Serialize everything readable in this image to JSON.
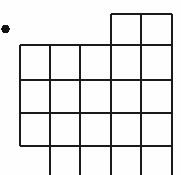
{
  "figure": {
    "kind": "grid-polyomino-diagram",
    "width": 181,
    "height": 175,
    "background_color": "#fefefe",
    "line_color": "#1a1a1a",
    "line_width": 2.2,
    "dot_color": "#111111",
    "marker": {
      "name": "bullet-dot",
      "cx": 5.5,
      "cy": 29,
      "r": 4.2
    },
    "geometry": {
      "column_x": [
        20,
        50,
        80,
        111,
        141,
        172
      ],
      "row_y": [
        14,
        45,
        80,
        113,
        146,
        178
      ],
      "columns": 5,
      "rows": 5,
      "cell_width": 30.4,
      "cell_height": 32.8,
      "clipped_bottom": true
    },
    "segments": {
      "horizontal": [
        {
          "name": "h-top-partial",
          "y": 14,
          "x1": 111,
          "x2": 172
        },
        {
          "name": "h-second",
          "y": 45,
          "x1": 20,
          "x2": 172
        },
        {
          "name": "h-third",
          "y": 80,
          "x1": 20,
          "x2": 172
        },
        {
          "name": "h-fourth",
          "y": 113,
          "x1": 20,
          "x2": 172
        },
        {
          "name": "h-fifth",
          "y": 146,
          "x1": 20,
          "x2": 172
        }
      ],
      "vertical": [
        {
          "name": "v-col1-left",
          "x": 20,
          "y1": 45,
          "y2": 146
        },
        {
          "name": "v-col2-left",
          "x": 50,
          "y1": 45,
          "y2": 175
        },
        {
          "name": "v-col3-left",
          "x": 80,
          "y1": 45,
          "y2": 175
        },
        {
          "name": "v-col4-left",
          "x": 111,
          "y1": 14,
          "y2": 175
        },
        {
          "name": "v-col5-left",
          "x": 141,
          "y1": 14,
          "y2": 175
        },
        {
          "name": "v-col5-right",
          "x": 172,
          "y1": 14,
          "y2": 175
        }
      ]
    },
    "cells": [
      {
        "name": "cell-r1c4",
        "row": 1,
        "col": 4
      },
      {
        "name": "cell-r1c5",
        "row": 1,
        "col": 5
      },
      {
        "name": "cell-r2c1",
        "row": 2,
        "col": 1
      },
      {
        "name": "cell-r2c2",
        "row": 2,
        "col": 2
      },
      {
        "name": "cell-r2c3",
        "row": 2,
        "col": 3
      },
      {
        "name": "cell-r2c4",
        "row": 2,
        "col": 4
      },
      {
        "name": "cell-r2c5",
        "row": 2,
        "col": 5
      },
      {
        "name": "cell-r3c1",
        "row": 3,
        "col": 1
      },
      {
        "name": "cell-r3c2",
        "row": 3,
        "col": 2
      },
      {
        "name": "cell-r3c3",
        "row": 3,
        "col": 3
      },
      {
        "name": "cell-r3c4",
        "row": 3,
        "col": 4
      },
      {
        "name": "cell-r3c5",
        "row": 3,
        "col": 5
      },
      {
        "name": "cell-r4c1",
        "row": 4,
        "col": 1
      },
      {
        "name": "cell-r4c2",
        "row": 4,
        "col": 2
      },
      {
        "name": "cell-r4c3",
        "row": 4,
        "col": 3
      },
      {
        "name": "cell-r4c4",
        "row": 4,
        "col": 4
      },
      {
        "name": "cell-r4c5",
        "row": 4,
        "col": 5
      },
      {
        "name": "cell-r5c2",
        "row": 5,
        "col": 2
      },
      {
        "name": "cell-r5c3",
        "row": 5,
        "col": 3
      },
      {
        "name": "cell-r5c4",
        "row": 5,
        "col": 4
      },
      {
        "name": "cell-r5c5",
        "row": 5,
        "col": 5
      }
    ]
  }
}
